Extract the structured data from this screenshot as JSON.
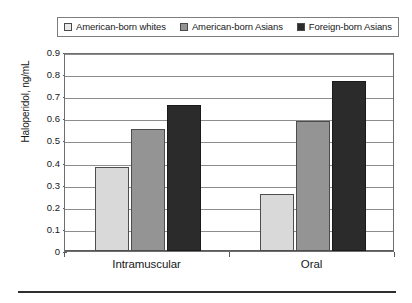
{
  "chart_data": {
    "type": "bar",
    "title": "",
    "xlabel": "",
    "ylabel": "Haloperidol, ng/mL",
    "categories": [
      "Intramuscular",
      "Oral"
    ],
    "series": [
      {
        "name": "American-born whites",
        "color": "#d9d9d9",
        "values": [
          0.38,
          0.26
        ]
      },
      {
        "name": "American-born Asians",
        "color": "#949494",
        "values": [
          0.55,
          0.59
        ]
      },
      {
        "name": "Foreign-born Asians",
        "color": "#2b2b2b",
        "values": [
          0.66,
          0.77
        ]
      }
    ],
    "ylim": [
      0,
      0.9
    ],
    "ytick_values": [
      0,
      0.1,
      0.2,
      0.3,
      0.4,
      0.5,
      0.6,
      0.7,
      0.8,
      0.9
    ],
    "ytick_labels": [
      "0",
      "0.1",
      "0.2",
      "0.3",
      "0.4",
      "0.5",
      "0.6",
      "0.7",
      "0.8",
      "0.9"
    ],
    "grid": "horizontal",
    "legend_position": "top"
  },
  "legend": {
    "items": [
      {
        "label": "American-born whites",
        "swatch": "legend-swatch-white"
      },
      {
        "label": "American-born Asians",
        "swatch": "legend-swatch-gray"
      },
      {
        "label": "Foreign-born Asians",
        "swatch": "legend-swatch-black"
      }
    ]
  },
  "axes": {
    "y_title": "Haloperidol, ng/mL"
  }
}
